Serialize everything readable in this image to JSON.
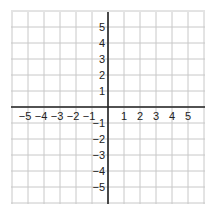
{
  "chart_data": {
    "type": "coordinate-grid",
    "title": "",
    "xlabel": "",
    "ylabel": "",
    "xlim": [
      -6,
      6
    ],
    "ylim": [
      -6,
      6
    ],
    "grid": true,
    "x_tick_labels": [
      "−5",
      "−4",
      "−3",
      "−2",
      "−1",
      "1",
      "2",
      "3",
      "4",
      "5"
    ],
    "x_tick_values": [
      -5,
      -4,
      -3,
      -2,
      -1,
      1,
      2,
      3,
      4,
      5
    ],
    "y_tick_labels": [
      "5",
      "4",
      "3",
      "2",
      "1",
      "−1",
      "−2",
      "−3",
      "−4",
      "−5"
    ],
    "y_tick_values": [
      5,
      4,
      3,
      2,
      1,
      -1,
      -2,
      -3,
      -4,
      -5
    ]
  },
  "colors": {
    "grid": "#c8c8c8",
    "axis": "#222222",
    "label": "#222222"
  }
}
